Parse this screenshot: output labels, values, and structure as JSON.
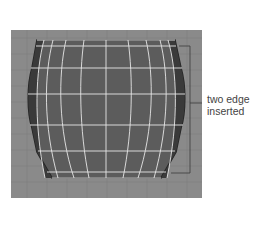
{
  "figure": {
    "viewport": {
      "background_color": "#8a8a8a",
      "grid_color": "#7c7c7c",
      "mesh": {
        "shape": "barrel",
        "fill_color": "#5a5a5a",
        "edge_color": "#e8e8e8",
        "rim_color": "#2e2e2e"
      }
    },
    "annotation": {
      "line1": "two edge",
      "line2": "inserted"
    }
  }
}
